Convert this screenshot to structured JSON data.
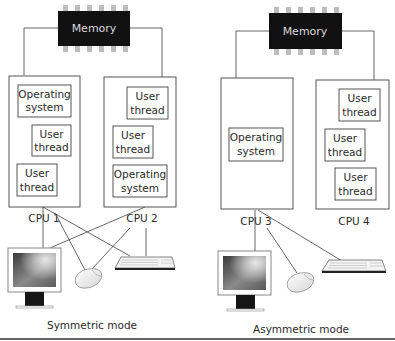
{
  "colors": {
    "memory_chip": "#111111",
    "memory_pins": "#bdbdbd",
    "box_stroke": "#555555",
    "wire": "#555555",
    "text": "#2a2a2a",
    "baseline": "#333333"
  },
  "symmetric": {
    "caption": "Symmetric mode",
    "memory": {
      "label": "Memory"
    },
    "cpus": [
      {
        "label": "CPU 1",
        "blocks": [
          {
            "line1": "Operating",
            "line2": "system"
          },
          {
            "line1": "User",
            "line2": "thread"
          },
          {
            "line1": "User",
            "line2": "thread"
          }
        ]
      },
      {
        "label": "CPU 2",
        "blocks": [
          {
            "line1": "User",
            "line2": "thread"
          },
          {
            "line1": "User",
            "line2": "thread"
          },
          {
            "line1": "Operating",
            "line2": "system"
          }
        ]
      }
    ],
    "peripherals": [
      "monitor-icon",
      "mouse-icon",
      "keyboard-icon"
    ],
    "connections": "Both CPU 1 and CPU 2 connect to monitor, mouse and keyboard"
  },
  "asymmetric": {
    "caption": "Asymmetric mode",
    "memory": {
      "label": "Memory"
    },
    "cpus": [
      {
        "label": "CPU 3",
        "blocks": [
          {
            "line1": "Operating",
            "line2": "system"
          }
        ]
      },
      {
        "label": "CPU 4",
        "blocks": [
          {
            "line1": "User",
            "line2": "thread"
          },
          {
            "line1": "User",
            "line2": "thread"
          },
          {
            "line1": "User",
            "line2": "thread"
          }
        ]
      }
    ],
    "peripherals": [
      "monitor-icon",
      "mouse-icon",
      "keyboard-icon"
    ],
    "connections": "Only CPU 3 connects to monitor, mouse and keyboard"
  }
}
